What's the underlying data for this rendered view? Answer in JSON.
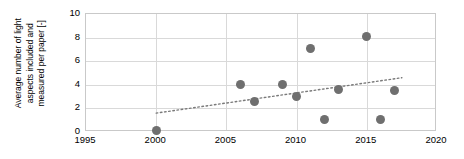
{
  "chart_data": {
    "type": "scatter",
    "title": "",
    "xlabel": "",
    "ylabel": "Average number of light aspects included and measured per paper [-]",
    "ylabel_lines": [
      "Average number of light",
      "aspects included and",
      "measured per paper [-]"
    ],
    "xlim": [
      1995,
      2020
    ],
    "ylim": [
      0,
      10
    ],
    "xticks": [
      1995,
      2000,
      2005,
      2010,
      2015,
      2020
    ],
    "xtick_labels": [
      "1995",
      "2000",
      "2005",
      "2010",
      "2015",
      "2020"
    ],
    "yticks": [
      0,
      2,
      4,
      6,
      8,
      10
    ],
    "ytick_labels": [
      "0",
      "2",
      "4",
      "6",
      "8",
      "10"
    ],
    "grid": true,
    "legend": "none",
    "marker_color": "#6f6f6f",
    "grid_color": "#d9d9d9",
    "points": [
      {
        "x": 2000,
        "y": 0.1
      },
      {
        "x": 2006,
        "y": 4.05
      },
      {
        "x": 2007,
        "y": 2.55
      },
      {
        "x": 2009,
        "y": 4.05
      },
      {
        "x": 2010,
        "y": 3.05
      },
      {
        "x": 2011,
        "y": 7.05
      },
      {
        "x": 2012,
        "y": 1.1
      },
      {
        "x": 2013,
        "y": 3.6
      },
      {
        "x": 2015,
        "y": 8.1
      },
      {
        "x": 2016,
        "y": 1.1
      },
      {
        "x": 2017,
        "y": 3.55
      }
    ],
    "trendline": {
      "style": "dotted",
      "color": "#7a7a7a",
      "x_start": 2000,
      "y_start": 1.6,
      "x_end": 2017.5,
      "y_end": 4.6
    }
  }
}
